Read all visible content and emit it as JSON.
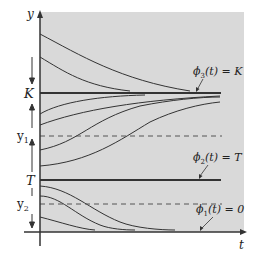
{
  "diagram": {
    "type": "phase-line / solution curves",
    "axes": {
      "x_label": "t",
      "y_label": "y"
    },
    "levels": {
      "K": "K",
      "T": "T",
      "y1": "y",
      "y1_sub": "1",
      "y2": "y",
      "y2_sub": "2"
    },
    "annotations": {
      "phi3": {
        "fn": "ϕ",
        "sub": "3",
        "arg": "(t) = K"
      },
      "phi2": {
        "fn": "ϕ",
        "sub": "2",
        "arg": "(t) = T"
      },
      "phi1": {
        "fn": "ϕ",
        "sub": "1",
        "arg": "(t) = 0"
      }
    },
    "colors": {
      "panel": "#d9d9d9",
      "line": "#333333",
      "background": "#ffffff"
    }
  }
}
